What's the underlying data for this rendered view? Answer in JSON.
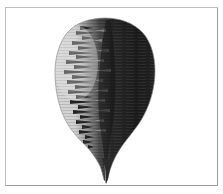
{
  "canvas": {
    "width": 223,
    "height": 194,
    "background_color": "#ffffff"
  },
  "frame": {
    "border_color": "#9a9a9a",
    "inner_highlight_color": "#bdbdbd",
    "fill_color": "#ffffff",
    "x": 5,
    "y": 7,
    "width": 213,
    "height": 179
  },
  "specimen": {
    "label": "feather-specimen",
    "description": "Single bird feather on white background, rounded broad vane tapering to a sharp pointed tip at the bottom",
    "light_vane_color": "#d6d6d6",
    "light_vane_shadow_color": "#c2c2c2",
    "dark_vane_color": "#232323",
    "dark_vane_deep_color": "#141414",
    "midrib_color": "#4a4a4a",
    "outline_color": "#8e8e8e",
    "tip_color": "#2b2b2b",
    "bounds": {
      "top": 18,
      "bottom": 181,
      "left": 56,
      "right": 155,
      "widest_y": 78
    },
    "split_x": 88
  }
}
